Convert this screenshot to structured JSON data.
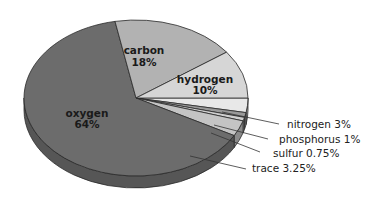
{
  "chart_data": {
    "type": "pie",
    "style": "3d-tilted",
    "title": "",
    "start_angle_deg": 0,
    "direction": "clockwise",
    "slices": [
      {
        "name": "nitrogen",
        "value": 3,
        "label": "nitrogen 3%",
        "color": "#e8e8e8",
        "side": "#a8a8a8",
        "label_pos": "outside"
      },
      {
        "name": "phosphorus",
        "value": 1,
        "label": "phosphorus 1%",
        "color": "#9a9a9a",
        "side": "#6e6e6e",
        "label_pos": "outside"
      },
      {
        "name": "sulfur",
        "value": 0.75,
        "label": "sulfur 0.75%",
        "color": "#d0d0d0",
        "side": "#8e8e8e",
        "label_pos": "outside"
      },
      {
        "name": "trace",
        "value": 3.25,
        "label": "trace 3.25%",
        "color": "#c4c4c4",
        "side": "#8a8a8a",
        "label_pos": "outside"
      },
      {
        "name": "oxygen",
        "value": 64,
        "label": "oxygen",
        "pct": "64%",
        "color": "#6c6c6c",
        "side": "#565656",
        "label_pos": "inside"
      },
      {
        "name": "carbon",
        "value": 18,
        "label": "carbon",
        "pct": "18%",
        "color": "#b2b2b2",
        "side": "#8a8a8a",
        "label_pos": "inside"
      },
      {
        "name": "hydrogen",
        "value": 10,
        "label": "hydrogen",
        "pct": "10%",
        "color": "#d6d6d6",
        "side": "#a0a0a0",
        "label_pos": "inside"
      }
    ],
    "labels": {
      "oxygen": {
        "name": "oxygen",
        "pct": "64%"
      },
      "carbon": {
        "name": "carbon",
        "pct": "18%"
      },
      "hydrogen": {
        "name": "hydrogen",
        "pct": "10%"
      },
      "nitrogen": "nitrogen 3%",
      "phosphorus": "phosphorus 1%",
      "sulfur": "sulfur 0.75%",
      "trace": "trace 3.25%"
    },
    "legend": "none",
    "unit": "%"
  }
}
